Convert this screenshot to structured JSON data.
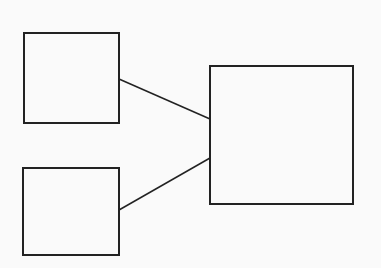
{
  "diagram": {
    "background": "#fafafa",
    "stroke": "#222222",
    "nodes": [
      {
        "id": "box-top-left",
        "x": 24,
        "y": 33,
        "w": 95,
        "h": 90
      },
      {
        "id": "box-bottom-left",
        "x": 23,
        "y": 168,
        "w": 96,
        "h": 87
      },
      {
        "id": "box-right",
        "x": 210,
        "y": 66,
        "w": 143,
        "h": 138
      }
    ],
    "edges": [
      {
        "from": "box-top-left",
        "to": "box-right",
        "x1": 119,
        "y1": 79,
        "x2": 210,
        "y2": 119
      },
      {
        "from": "box-bottom-left",
        "to": "box-right",
        "x1": 119,
        "y1": 210,
        "x2": 210,
        "y2": 158
      }
    ]
  }
}
